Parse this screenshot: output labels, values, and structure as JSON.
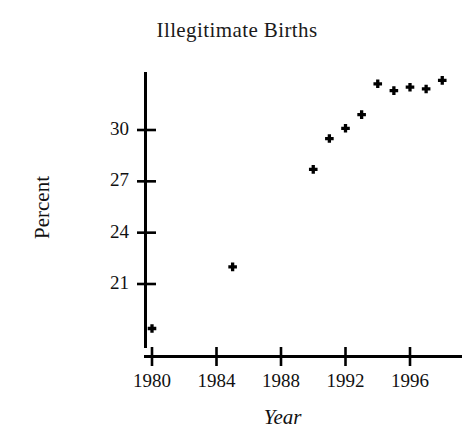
{
  "chart_data": {
    "type": "scatter",
    "title": "Illegitimate Births",
    "xlabel": "Year",
    "ylabel": "Percent",
    "x": [
      1980,
      1985,
      1990,
      1991,
      1992,
      1993,
      1994,
      1995,
      1996,
      1997,
      1998
    ],
    "values": [
      18.4,
      22.0,
      27.7,
      29.5,
      30.1,
      30.9,
      32.7,
      32.3,
      32.5,
      32.4,
      32.9
    ],
    "points": [
      {
        "year": 1980,
        "percent": 18.4
      },
      {
        "year": 1985,
        "percent": 22.0
      },
      {
        "year": 1990,
        "percent": 27.7
      },
      {
        "year": 1991,
        "percent": 29.5
      },
      {
        "year": 1992,
        "percent": 30.1
      },
      {
        "year": 1993,
        "percent": 30.9
      },
      {
        "year": 1994,
        "percent": 32.7
      },
      {
        "year": 1995,
        "percent": 32.3
      },
      {
        "year": 1996,
        "percent": 32.5
      },
      {
        "year": 1997,
        "percent": 32.4
      },
      {
        "year": 1998,
        "percent": 32.9
      }
    ],
    "xticks": [
      1980,
      1984,
      1988,
      1992,
      1996
    ],
    "xtick_labels": [
      "1980",
      "1984",
      "1988",
      "1992",
      "1996"
    ],
    "yticks": [
      21,
      24,
      27,
      30
    ],
    "ytick_labels": [
      "21",
      "24",
      "27",
      "30"
    ],
    "xlim": [
      1979.5,
      1999.0
    ],
    "ylim": [
      17.9,
      33.8
    ],
    "grid": false,
    "legend": null,
    "marker": "plus",
    "marker_color": "#000000",
    "axis_color": "#000000"
  },
  "axis_labels": {
    "y_title": "Percent",
    "x_title": "Year"
  }
}
